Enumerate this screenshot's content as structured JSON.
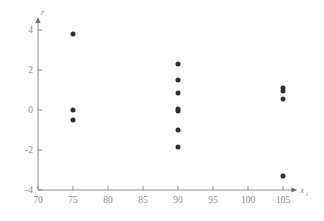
{
  "chart_data": {
    "type": "scatter",
    "title": "",
    "xlabel": "x1",
    "ylabel": "r",
    "xlim": [
      70,
      106.5
    ],
    "ylim": [
      -4,
      4.4
    ],
    "xticks": [
      70,
      75,
      80,
      85,
      90,
      95,
      100,
      105
    ],
    "xtick_labels": [
      "70",
      "75",
      "80",
      "85",
      "90",
      "95",
      "100",
      "105"
    ],
    "yticks": [
      -4,
      -2,
      0,
      2,
      4
    ],
    "ytick_labels": [
      "-4",
      "-2",
      "0",
      "2",
      "4"
    ],
    "grid": false,
    "legend": null,
    "marker": "filled-circle",
    "marker_color": "#2e2e2e",
    "axis_color": "#8a8a8a",
    "series": [
      {
        "name": "residuals",
        "points": [
          {
            "x": 75,
            "y": 3.8
          },
          {
            "x": 75,
            "y": 0.0
          },
          {
            "x": 75,
            "y": -0.5
          },
          {
            "x": 90,
            "y": 2.3
          },
          {
            "x": 90,
            "y": 1.5
          },
          {
            "x": 90,
            "y": 0.85
          },
          {
            "x": 90,
            "y": 0.05
          },
          {
            "x": 90,
            "y": -0.05
          },
          {
            "x": 90,
            "y": -1.0
          },
          {
            "x": 90,
            "y": -1.85
          },
          {
            "x": 105,
            "y": 1.1
          },
          {
            "x": 105,
            "y": 0.95
          },
          {
            "x": 105,
            "y": 0.55
          },
          {
            "x": 105,
            "y": -3.3
          }
        ]
      }
    ]
  },
  "labels": {
    "y_axis_symbol": "r",
    "x_axis_symbol": "x",
    "x_axis_subscript": "1"
  }
}
